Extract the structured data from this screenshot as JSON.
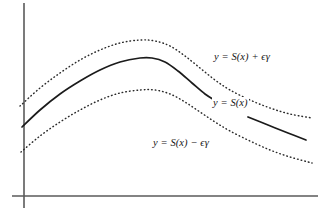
{
  "figure": {
    "background_color": "#ffffff",
    "width": 322,
    "height": 220
  },
  "axes": {
    "axis_color": "#5a5a5a",
    "y_axis": {
      "x": 24,
      "y_top": 3,
      "y_bottom": 208
    },
    "x_axis": {
      "y": 196,
      "x_left": 12,
      "x_right": 318
    }
  },
  "labels": {
    "upper": "y = S(x) + ϵγ",
    "middle": "y = S(x)",
    "lower": "y = S(x) − ϵγ"
  },
  "chart_data": {
    "type": "line",
    "title": "",
    "xlabel": "",
    "ylabel": "",
    "grid": false,
    "legend_position": "inline-annotations",
    "axis_style": "bare-axes-no-ticks",
    "series": [
      {
        "name": "y = S(x) + ϵγ",
        "style": "dotted",
        "color": "#2a2a2a",
        "note": "upper envelope curve, drawn as fine dots, passes behind its label",
        "points": [
          [
            20,
            106
          ],
          [
            40,
            88
          ],
          [
            60,
            73
          ],
          [
            80,
            60
          ],
          [
            100,
            50
          ],
          [
            120,
            43
          ],
          [
            140,
            40
          ],
          [
            155,
            41
          ],
          [
            170,
            46
          ],
          [
            185,
            56
          ],
          [
            200,
            68
          ],
          [
            215,
            80
          ],
          [
            230,
            90
          ],
          [
            250,
            100
          ],
          [
            270,
            108
          ],
          [
            290,
            114
          ],
          [
            312,
            118
          ]
        ]
      },
      {
        "name": "y = S(x)",
        "style": "solid",
        "color": "#1b1b1b",
        "note": "central solid curve, broken by the y = S(x) label then resumed",
        "segments": [
          {
            "points": [
              [
                22,
                127
              ],
              [
                40,
                110
              ],
              [
                60,
                94
              ],
              [
                80,
                81
              ],
              [
                100,
                70
              ],
              [
                120,
                62
              ],
              [
                140,
                58
              ],
              [
                152,
                58
              ],
              [
                165,
                62
              ],
              [
                178,
                71
              ],
              [
                192,
                83
              ],
              [
                205,
                94
              ],
              [
                216,
                101
              ]
            ]
          },
          {
            "points": [
              [
                248,
                117
              ],
              [
                268,
                125
              ],
              [
                288,
                133
              ],
              [
                306,
                140
              ]
            ]
          }
        ]
      },
      {
        "name": "y = S(x) − ϵγ",
        "style": "dotted",
        "color": "#2a2a2a",
        "note": "lower envelope curve, drawn as fine dots, passes behind its label",
        "points": [
          [
            21,
            152
          ],
          [
            40,
            136
          ],
          [
            60,
            122
          ],
          [
            80,
            110
          ],
          [
            100,
            100
          ],
          [
            120,
            93
          ],
          [
            140,
            90
          ],
          [
            155,
            90
          ],
          [
            170,
            94
          ],
          [
            185,
            102
          ],
          [
            200,
            112
          ],
          [
            215,
            122
          ],
          [
            230,
            131
          ],
          [
            250,
            141
          ],
          [
            270,
            150
          ],
          [
            290,
            157
          ],
          [
            312,
            163
          ]
        ]
      }
    ]
  }
}
